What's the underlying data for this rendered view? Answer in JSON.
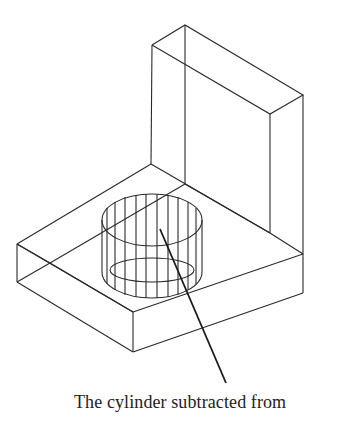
{
  "figure": {
    "line_color": "#2a2a2a",
    "background": "#ffffff"
  },
  "annotation": {
    "caption": "The cylinder subtracted from",
    "leader_from": [
      160,
      229
    ],
    "leader_to": [
      226,
      383
    ]
  }
}
